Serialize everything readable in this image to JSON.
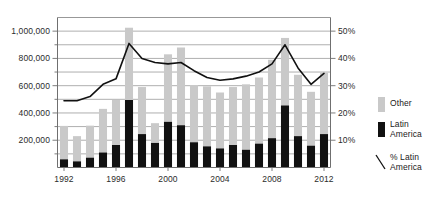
{
  "chart_data": {
    "type": "bar",
    "subtype": "stacked-bar-with-line",
    "title": "",
    "subtitle": "",
    "xlabel": "",
    "ylabel": "",
    "y2label": "",
    "grid": true,
    "legend_position": "right",
    "categories": [
      1992,
      1993,
      1994,
      1995,
      1996,
      1997,
      1998,
      1999,
      2000,
      2001,
      2002,
      2003,
      2004,
      2005,
      2006,
      2007,
      2008,
      2009,
      2010,
      2011,
      2012
    ],
    "x_tick_labels": [
      "1992",
      "1996",
      "2000",
      "2004",
      "2008",
      "2012"
    ],
    "x_tick_years": [
      1992,
      1996,
      2000,
      2004,
      2008,
      2012
    ],
    "ylim": [
      0,
      1100000
    ],
    "y_tick_labels": [
      "200,000",
      "400,000",
      "600,000",
      "800,000",
      "1,000,000"
    ],
    "y_ticks": [
      200000,
      400000,
      600000,
      800000,
      1000000
    ],
    "y_minor_ticks": [
      100000,
      300000,
      500000,
      700000,
      900000,
      1100000
    ],
    "y2lim": [
      0,
      55
    ],
    "y2_tick_labels": [
      "10%",
      "20%",
      "30%",
      "40%",
      "50%"
    ],
    "y2_ticks": [
      10,
      20,
      30,
      40,
      50
    ],
    "series": [
      {
        "name": "Latin America",
        "type": "bar",
        "color": "#111111",
        "values": [
          60000,
          45000,
          72000,
          110000,
          165000,
          495000,
          245000,
          180000,
          335000,
          310000,
          185000,
          155000,
          140000,
          165000,
          130000,
          175000,
          215000,
          455000,
          230000,
          160000,
          245000
        ]
      },
      {
        "name": "Other",
        "type": "bar",
        "color": "#c9c9c9",
        "values": [
          245000,
          185000,
          235000,
          320000,
          330000,
          530000,
          345000,
          145000,
          495000,
          570000,
          420000,
          440000,
          410000,
          425000,
          480000,
          485000,
          575000,
          495000,
          450000,
          395000,
          450000
        ]
      },
      {
        "name": "% Latin America",
        "type": "line",
        "color": "#111111",
        "values": [
          24.5,
          24.5,
          26.0,
          30.5,
          32.5,
          45.5,
          40.0,
          38.5,
          38.0,
          38.5,
          35.5,
          33.0,
          32.0,
          32.5,
          33.5,
          35.0,
          38.0,
          45.0,
          36.5,
          30.5,
          34.5
        ]
      }
    ]
  },
  "legend": {
    "items": [
      {
        "label": "Other",
        "swatch": "bar-swatch",
        "color": "#c9c9c9"
      },
      {
        "label": "Latin\nAmerica",
        "swatch": "bar-swatch",
        "color": "#111111"
      },
      {
        "label": "% Latin\nAmerica",
        "swatch": "line-swatch",
        "color": "#111111"
      }
    ]
  },
  "colors": {
    "other_bar": "#c9c9c9",
    "latin_bar": "#111111",
    "line": "#111111",
    "gridline": "#8c8c8c",
    "axis": "#6f6f6f",
    "text": "#1a1a1a",
    "background": "#ffffff"
  }
}
